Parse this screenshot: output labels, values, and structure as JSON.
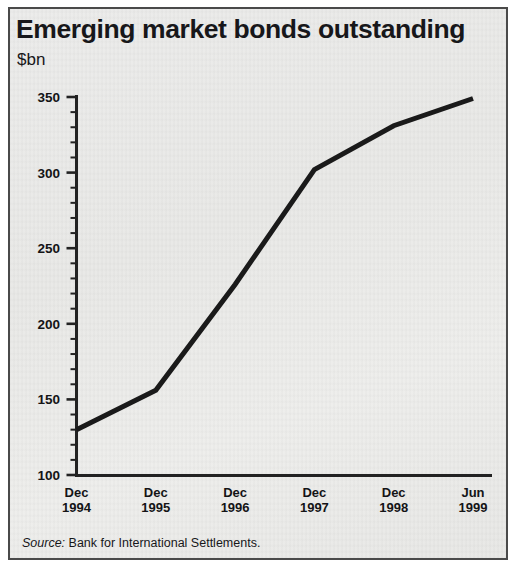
{
  "panel": {
    "title": "Emerging market bonds outstanding",
    "unit": "$bn",
    "source_label": "Source:",
    "source_text": "Bank for International Settlements."
  },
  "chart_data": {
    "type": "line",
    "title": "Emerging market bonds outstanding",
    "subtitle": "$bn",
    "xlabel": "",
    "ylabel": "$bn",
    "categories": [
      "Dec 1994",
      "Dec 1995",
      "Dec 1996",
      "Dec 1997",
      "Dec 1998",
      "Jun 1999"
    ],
    "x_tick_lines": [
      {
        "month": "Dec",
        "year": "1994"
      },
      {
        "month": "Dec",
        "year": "1995"
      },
      {
        "month": "Dec",
        "year": "1996"
      },
      {
        "month": "Dec",
        "year": "1997"
      },
      {
        "month": "Dec",
        "year": "1998"
      },
      {
        "month": "Jun",
        "year": "1999"
      }
    ],
    "values": [
      130,
      156,
      226,
      302,
      331,
      349
    ],
    "series": [
      {
        "name": "Emerging market bonds outstanding",
        "values": [
          130,
          156,
          226,
          302,
          331,
          349
        ],
        "color": "#1a1a1a"
      }
    ],
    "ylim": [
      100,
      350
    ],
    "y_major_ticks": [
      100,
      150,
      200,
      250,
      300,
      350
    ],
    "y_major_tick_labels": [
      "100",
      "150",
      "200",
      "250",
      "300",
      "350"
    ],
    "y_minor_tick_step": 10,
    "grid": false,
    "legend": "none",
    "line_color": "#1a1a1a",
    "line_width_px": 5,
    "axis_color": "#222222",
    "background_color": "#ebebe9",
    "border_color": "#4a4a4a"
  }
}
